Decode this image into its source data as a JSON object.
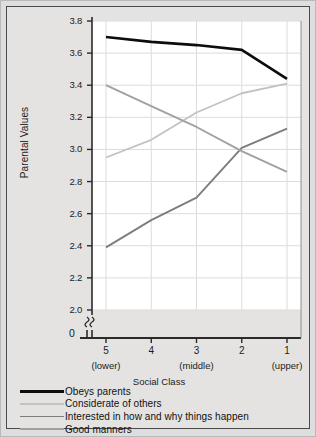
{
  "chart_data": {
    "type": "line",
    "title": "",
    "xlabel": "Social Class",
    "ylabel": "Parental Values",
    "x": [
      "5",
      "4",
      "3",
      "2",
      "1"
    ],
    "x_sublabels": [
      "(lower)",
      "",
      "(middle)",
      "",
      "(upper)"
    ],
    "xtick_labels": [
      "5",
      "4",
      "3",
      "2",
      "1"
    ],
    "ytick_labels": [
      "3.8",
      "3.6",
      "3.4",
      "3.2",
      "3.0",
      "2.8",
      "2.6",
      "2.4",
      "2.2",
      "2.0"
    ],
    "ytick_values": [
      3.8,
      3.6,
      3.4,
      3.2,
      3.0,
      2.8,
      2.6,
      2.4,
      2.2,
      2.0
    ],
    "ylim": [
      2.0,
      3.8
    ],
    "axis_break_label": "0",
    "axis_break": true,
    "grid": true,
    "legend_position": "below",
    "series": [
      {
        "name": "Obeys parents",
        "values": [
          3.7,
          3.67,
          3.65,
          3.62,
          3.44
        ],
        "color": "#0d0d0d",
        "width": 2.6
      },
      {
        "name": "Considerate of others",
        "values": [
          2.95,
          3.06,
          3.23,
          3.35,
          3.41
        ],
        "color": "#c2c2c2",
        "width": 1.8
      },
      {
        "name": "Interested in how and why things happen",
        "values": [
          2.39,
          2.56,
          2.7,
          3.01,
          3.13
        ],
        "color": "#7d7d7d",
        "width": 1.9
      },
      {
        "name": "Good manners",
        "values": [
          3.4,
          3.27,
          3.14,
          2.99,
          2.86
        ],
        "color": "#a1a1a1",
        "width": 1.9
      }
    ]
  },
  "colors": {
    "page_background": "#dedede",
    "panel_background": "#e4e3e1",
    "plot_background": "#ffffff",
    "grid": "#dcdcdc",
    "axis": "#2a2a2a",
    "text": "#1c1c1c",
    "frame_border": "#4a4a4a"
  }
}
